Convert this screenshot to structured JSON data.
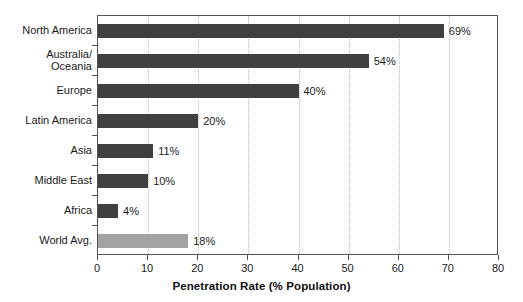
{
  "chart_data": {
    "type": "bar",
    "orientation": "horizontal",
    "title": "",
    "xlabel": "Penetration Rate (% Population)",
    "ylabel": "",
    "xlim": [
      0,
      80
    ],
    "xticks": [
      0,
      10,
      20,
      30,
      40,
      50,
      60,
      70,
      80
    ],
    "xtick_labels": [
      "0",
      "10",
      "20",
      "30",
      "40",
      "50",
      "60",
      "70",
      "80"
    ],
    "grid": "vertical-dotted",
    "legend": "none",
    "categories": [
      "North America",
      "Australia/ Oceania",
      "Europe",
      "Latin America",
      "Asia",
      "Middle East",
      "Africa",
      "World Avg."
    ],
    "values": [
      69,
      54,
      40,
      20,
      11,
      10,
      4,
      18
    ],
    "value_labels": [
      "69%",
      "54%",
      "40%",
      "20%",
      "11%",
      "10%",
      "4%",
      "18%"
    ],
    "colors": {
      "bar": "#404040",
      "highlight_bar": "#a3a3a3",
      "axis": "#555555",
      "grid": "#bdbdbd",
      "background": "#ffffff",
      "text": "#1a1a1a"
    },
    "bars": [
      {
        "label_lines": [
          "North America"
        ],
        "value": 69,
        "value_label": "69%",
        "highlight": false
      },
      {
        "label_lines": [
          "Australia/",
          "Oceania"
        ],
        "value": 54,
        "value_label": "54%",
        "highlight": false
      },
      {
        "label_lines": [
          "Europe"
        ],
        "value": 40,
        "value_label": "40%",
        "highlight": false
      },
      {
        "label_lines": [
          "Latin America"
        ],
        "value": 20,
        "value_label": "20%",
        "highlight": false
      },
      {
        "label_lines": [
          "Asia"
        ],
        "value": 11,
        "value_label": "11%",
        "highlight": false
      },
      {
        "label_lines": [
          "Middle East"
        ],
        "value": 10,
        "value_label": "10%",
        "highlight": false
      },
      {
        "label_lines": [
          "Africa"
        ],
        "value": 4,
        "value_label": "4%",
        "highlight": false
      },
      {
        "label_lines": [
          "World Avg."
        ],
        "value": 18,
        "value_label": "18%",
        "highlight": true
      }
    ]
  }
}
